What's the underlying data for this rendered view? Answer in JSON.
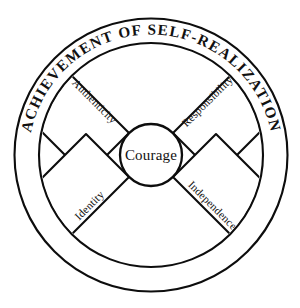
{
  "diagram": {
    "ring": {
      "label": "ACHIEVEMENT OF SELF-REALIZATION"
    },
    "hub": {
      "label": "Courage"
    },
    "sectors": [
      {
        "id": "authenticity",
        "label": "Authenticity",
        "position": "top-left"
      },
      {
        "id": "responsibility",
        "label": "Responsibility",
        "position": "top-right"
      },
      {
        "id": "identity",
        "label": "Identity",
        "position": "bottom-left"
      },
      {
        "id": "independence",
        "label": "Independence",
        "position": "bottom-right"
      }
    ],
    "colors": {
      "stroke": "#0d0d0d",
      "fill": "#ffffff",
      "text": "#111111",
      "background": "#ffffff"
    }
  }
}
